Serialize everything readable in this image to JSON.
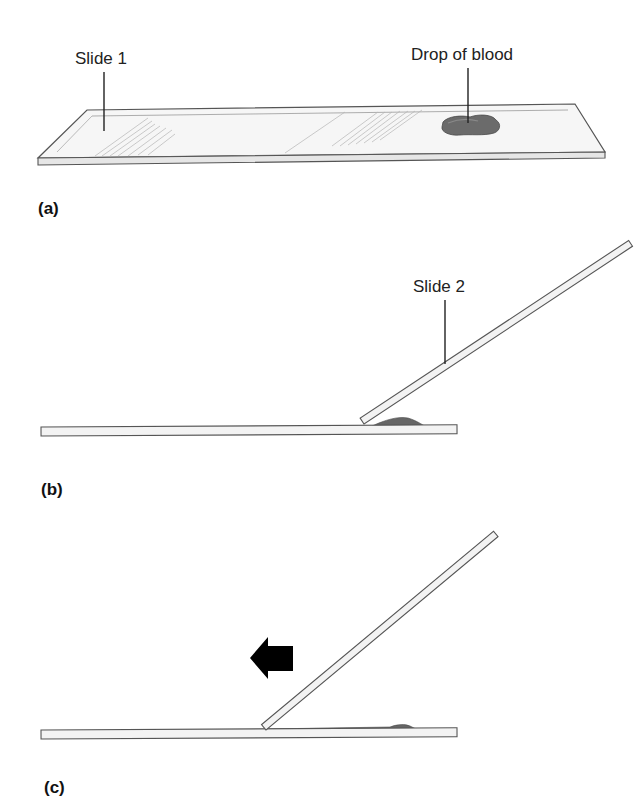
{
  "figure": {
    "panels": [
      {
        "id": "a",
        "label": "(a)",
        "callouts": [
          {
            "text": "Slide 1",
            "target": "slide-1"
          },
          {
            "text": "Drop of blood",
            "target": "blood-drop"
          }
        ]
      },
      {
        "id": "b",
        "label": "(b)",
        "callouts": [
          {
            "text": "Slide 2",
            "target": "slide-2"
          }
        ]
      },
      {
        "id": "c",
        "label": "(c)",
        "arrow_direction": "left"
      }
    ]
  },
  "colors": {
    "slide_fill": "#f4f4f4",
    "slide_edge": "#5a5a5a",
    "blood": "#6a6a6a",
    "arrow": "#000000"
  }
}
